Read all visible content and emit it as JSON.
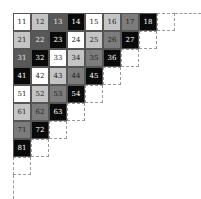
{
  "diagram": {
    "title": "",
    "cell_size": 18,
    "origin": {
      "x": 13,
      "y": 13
    },
    "shades": {
      "white": "#ffffff",
      "light": "#c4c4c4",
      "mid": "#7c7c7c",
      "dark": "#585858",
      "black": "#0a0a0a"
    },
    "text_colors": {
      "white": "#222222",
      "light": "#222222",
      "mid": "#222222",
      "dark": "#e8e8e8",
      "black": "#ffffff"
    },
    "rows": [
      {
        "row": 1,
        "cells": [
          {
            "label": "11",
            "shade": "white"
          },
          {
            "label": "12",
            "shade": "light"
          },
          {
            "label": "13",
            "shade": "dark"
          },
          {
            "label": "14",
            "shade": "black"
          },
          {
            "label": "15",
            "shade": "white"
          },
          {
            "label": "16",
            "shade": "light"
          },
          {
            "label": "17",
            "shade": "mid"
          },
          {
            "label": "18",
            "shade": "black"
          }
        ]
      },
      {
        "row": 2,
        "cells": [
          {
            "label": "21",
            "shade": "light"
          },
          {
            "label": "22",
            "shade": "dark"
          },
          {
            "label": "23",
            "shade": "black"
          },
          {
            "label": "24",
            "shade": "white"
          },
          {
            "label": "25",
            "shade": "light"
          },
          {
            "label": "26",
            "shade": "mid"
          },
          {
            "label": "27",
            "shade": "black"
          }
        ]
      },
      {
        "row": 3,
        "cells": [
          {
            "label": "31",
            "shade": "dark"
          },
          {
            "label": "32",
            "shade": "black"
          },
          {
            "label": "33",
            "shade": "white"
          },
          {
            "label": "34",
            "shade": "light"
          },
          {
            "label": "35",
            "shade": "mid"
          },
          {
            "label": "36",
            "shade": "black"
          }
        ]
      },
      {
        "row": 4,
        "cells": [
          {
            "label": "41",
            "shade": "black"
          },
          {
            "label": "42",
            "shade": "white"
          },
          {
            "label": "43",
            "shade": "light"
          },
          {
            "label": "44",
            "shade": "mid"
          },
          {
            "label": "45",
            "shade": "black"
          }
        ]
      },
      {
        "row": 5,
        "cells": [
          {
            "label": "51",
            "shade": "white"
          },
          {
            "label": "52",
            "shade": "light"
          },
          {
            "label": "53",
            "shade": "mid"
          },
          {
            "label": "54",
            "shade": "black"
          }
        ]
      },
      {
        "row": 6,
        "cells": [
          {
            "label": "61",
            "shade": "light"
          },
          {
            "label": "62",
            "shade": "mid"
          },
          {
            "label": "63",
            "shade": "black"
          }
        ]
      },
      {
        "row": 7,
        "cells": [
          {
            "label": "71",
            "shade": "mid"
          },
          {
            "label": "72",
            "shade": "black"
          }
        ]
      },
      {
        "row": 8,
        "cells": [
          {
            "label": "81",
            "shade": "black"
          }
        ]
      }
    ],
    "dashed_cells_note": "empty dashed outline cell at the end of each row, plus a dashed extension along the top edge and left edge"
  }
}
